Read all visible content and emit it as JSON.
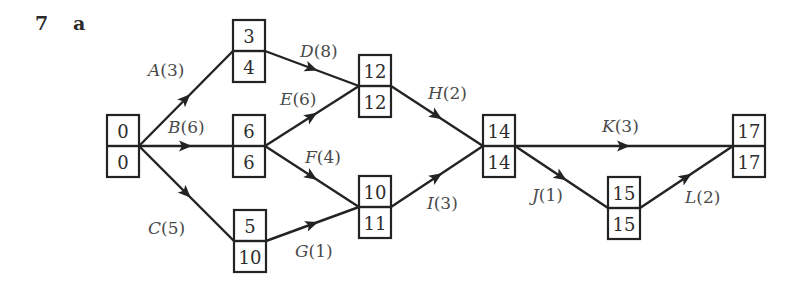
{
  "question_number": "7",
  "part_label": "a",
  "diagram": {
    "type": "activity-network",
    "nodes": [
      {
        "id": "n0",
        "early": "0",
        "late": "0",
        "x": 107,
        "y": 115
      },
      {
        "id": "n1",
        "early": "3",
        "late": "4",
        "x": 233,
        "y": 20
      },
      {
        "id": "n2",
        "early": "6",
        "late": "6",
        "x": 233,
        "y": 115
      },
      {
        "id": "n3",
        "early": "5",
        "late": "10",
        "x": 234,
        "y": 210
      },
      {
        "id": "n4",
        "early": "12",
        "late": "12",
        "x": 359,
        "y": 55
      },
      {
        "id": "n5",
        "early": "10",
        "late": "11",
        "x": 359,
        "y": 176
      },
      {
        "id": "n6",
        "early": "14",
        "late": "14",
        "x": 483,
        "y": 115
      },
      {
        "id": "n7",
        "early": "15",
        "late": "15",
        "x": 608,
        "y": 177
      },
      {
        "id": "n8",
        "early": "17",
        "late": "17",
        "x": 733,
        "y": 115
      }
    ],
    "edges": [
      {
        "activity": "A",
        "duration": "3",
        "from": "n0",
        "to": "n1",
        "label_x": 148,
        "label_y": 76
      },
      {
        "activity": "B",
        "duration": "6",
        "from": "n0",
        "to": "n2",
        "label_x": 168,
        "label_y": 133
      },
      {
        "activity": "C",
        "duration": "5",
        "from": "n0",
        "to": "n3",
        "label_x": 148,
        "label_y": 234
      },
      {
        "activity": "D",
        "duration": "8",
        "from": "n1",
        "to": "n4",
        "label_x": 300,
        "label_y": 57
      },
      {
        "activity": "E",
        "duration": "6",
        "from": "n2",
        "to": "n4",
        "label_x": 280,
        "label_y": 105
      },
      {
        "activity": "F",
        "duration": "4",
        "from": "n2",
        "to": "n5",
        "label_x": 305,
        "label_y": 163
      },
      {
        "activity": "G",
        "duration": "1",
        "from": "n3",
        "to": "n5",
        "label_x": 295,
        "label_y": 257
      },
      {
        "activity": "H",
        "duration": "2",
        "from": "n4",
        "to": "n6",
        "label_x": 428,
        "label_y": 99
      },
      {
        "activity": "I",
        "duration": "3",
        "from": "n5",
        "to": "n6",
        "label_x": 427,
        "label_y": 209
      },
      {
        "activity": "J",
        "duration": "1",
        "from": "n6",
        "to": "n7",
        "label_x": 532,
        "label_y": 201
      },
      {
        "activity": "K",
        "duration": "3",
        "from": "n6",
        "to": "n8",
        "label_x": 602,
        "label_y": 132
      },
      {
        "activity": "L",
        "duration": "2",
        "from": "n7",
        "to": "n8",
        "label_x": 685,
        "label_y": 203
      }
    ]
  },
  "colors": {
    "line": "#232323",
    "node_text": "#2d2d2d",
    "label_text": "#4a4a4a",
    "background": "#ffffff"
  }
}
